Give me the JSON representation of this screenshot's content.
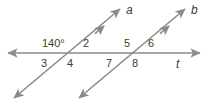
{
  "figure": {
    "colors": {
      "line": "#8a8a8a",
      "text": "#3b3b3b",
      "background": "#ffffff"
    },
    "lines": [
      {
        "name": "a",
        "label": "a",
        "label_x": 126,
        "label_y": 4,
        "x1": 14,
        "y1": 98,
        "x2": 120,
        "y2": 9,
        "arrows": "both"
      },
      {
        "name": "b",
        "label": "b",
        "label_x": 191,
        "label_y": 4,
        "x1": 79,
        "y1": 98,
        "x2": 185,
        "y2": 9,
        "arrows": "both"
      },
      {
        "name": "t",
        "label": "t",
        "label_x": 176,
        "label_y": 58,
        "x1": 8,
        "y1": 53,
        "x2": 200,
        "y2": 53,
        "arrows": "both"
      }
    ],
    "intersections": [
      {
        "name": "left",
        "x": 68,
        "y": 53
      },
      {
        "name": "right",
        "x": 133,
        "y": 53
      }
    ],
    "angle_labels": [
      {
        "id": "angle-140",
        "text": "140°",
        "x": 42,
        "y": 38,
        "kind": "measure"
      },
      {
        "id": "angle-2",
        "text": "2",
        "x": 83,
        "y": 38,
        "kind": "number"
      },
      {
        "id": "angle-3",
        "text": "3",
        "x": 41,
        "y": 58,
        "kind": "number"
      },
      {
        "id": "angle-4",
        "text": "4",
        "x": 67,
        "y": 58,
        "kind": "number"
      },
      {
        "id": "angle-5",
        "text": "5",
        "x": 124,
        "y": 38,
        "kind": "number"
      },
      {
        "id": "angle-6",
        "text": "6",
        "x": 148,
        "y": 38,
        "kind": "number"
      },
      {
        "id": "angle-7",
        "text": "7",
        "x": 106,
        "y": 58,
        "kind": "number"
      },
      {
        "id": "angle-8",
        "text": "8",
        "x": 132,
        "y": 58,
        "kind": "number"
      }
    ]
  }
}
